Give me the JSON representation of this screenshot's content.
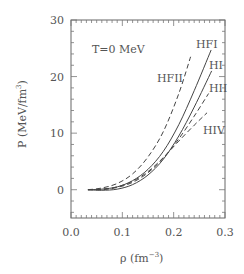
{
  "chart_data": {
    "type": "line",
    "title": "",
    "annotation": "T=0 MeV",
    "xlabel": "ρ (fm⁻³)",
    "xlabel_base": "ρ  (fm",
    "xlabel_sup": "−3",
    "xlabel_close": ")",
    "ylabel": "P (MeV/fm³)",
    "ylabel_base": "P (MeV/fm",
    "ylabel_sup": "3",
    "ylabel_close": ")",
    "xlim": [
      0.0,
      0.3
    ],
    "ylim": [
      -5,
      30
    ],
    "xticks": [
      0.0,
      0.1,
      0.2,
      0.3
    ],
    "xtick_labels": [
      "0.0",
      "0.1",
      "0.2",
      "0.3"
    ],
    "yticks": [
      0,
      10,
      20,
      30
    ],
    "ytick_labels": [
      "0",
      "10",
      "20",
      "30"
    ],
    "grid": false,
    "legend": "inline labels",
    "series": [
      {
        "name": "HFI",
        "style": "solid",
        "x": [
          0.033,
          0.06,
          0.09,
          0.12,
          0.15,
          0.18,
          0.21,
          0.24,
          0.273
        ],
        "y": [
          0.0,
          0.1,
          0.5,
          1.6,
          3.6,
          6.8,
          11.5,
          17.5,
          24.7
        ]
      },
      {
        "name": "HI",
        "style": "solid",
        "x": [
          0.033,
          0.06,
          0.09,
          0.12,
          0.15,
          0.18,
          0.21,
          0.24,
          0.274
        ],
        "y": [
          0.0,
          -0.1,
          0.1,
          0.9,
          2.6,
          5.4,
          9.5,
          14.6,
          21.0
        ]
      },
      {
        "name": "HFII",
        "style": "dashed",
        "x": [
          0.033,
          0.06,
          0.09,
          0.12,
          0.15,
          0.18,
          0.21,
          0.233
        ],
        "y": [
          0.0,
          0.3,
          1.1,
          2.8,
          5.8,
          10.3,
          17.0,
          23.5
        ]
      },
      {
        "name": "HII",
        "style": "dashed",
        "x": [
          0.033,
          0.06,
          0.09,
          0.12,
          0.15,
          0.18,
          0.21,
          0.24,
          0.268
        ],
        "y": [
          0.0,
          0.0,
          0.4,
          1.3,
          3.0,
          5.6,
          9.0,
          13.0,
          17.0
        ]
      },
      {
        "name": "HIV",
        "style": "dashed",
        "x": [
          0.033,
          0.06,
          0.09,
          0.12,
          0.15,
          0.18,
          0.21,
          0.24,
          0.265
        ],
        "y": [
          0.0,
          0.1,
          0.5,
          1.5,
          3.2,
          5.7,
          8.6,
          11.4,
          13.6
        ]
      }
    ]
  }
}
